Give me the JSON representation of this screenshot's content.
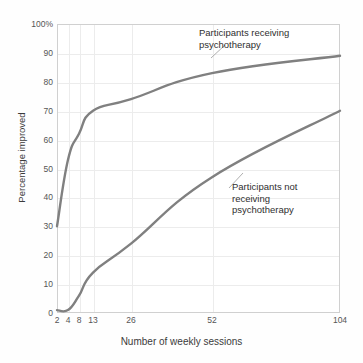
{
  "chart_data": {
    "type": "line",
    "title": "",
    "xlabel": "Number of weekly sessions",
    "ylabel": "Percentage improved",
    "x": [
      2,
      4,
      8,
      13,
      26,
      52,
      104
    ],
    "categories": [
      "2",
      "4",
      "8",
      "13",
      "26",
      "52",
      "104"
    ],
    "xtick_labels": [
      "2",
      "4",
      "8",
      "13",
      "26",
      "52",
      "104"
    ],
    "ytick_labels": [
      "0",
      "10",
      "20",
      "30",
      "40",
      "50",
      "60",
      "70",
      "80",
      "90",
      "100%"
    ],
    "ytick_values": [
      0,
      10,
      20,
      30,
      40,
      50,
      60,
      70,
      80,
      90,
      100
    ],
    "ylim": [
      0,
      100
    ],
    "xscale": "log",
    "grid": true,
    "legend": "annotations",
    "series": [
      {
        "name": "Participants receiving psychotherapy",
        "color": "#808080",
        "values": [
          30,
          53,
          62,
          70,
          74,
          83,
          89
        ]
      },
      {
        "name": "Participants not receiving psychotherapy",
        "color": "#808080",
        "values": [
          1,
          1,
          6,
          14,
          24,
          47,
          70
        ]
      }
    ],
    "annotations": [
      {
        "id": "treated",
        "text": "Participants receiving\npsychotherapy",
        "points_to_x": 52,
        "points_to_y": 83
      },
      {
        "id": "control",
        "text": "Participants not\nreceiving\npsychotherapy",
        "points_to_x": 63,
        "points_to_y": 53
      }
    ]
  },
  "axes": {
    "y_title": "Percentage improved",
    "x_title": "Number of weekly sessions"
  },
  "colors": {
    "line": "#808080",
    "grid": "#ececec",
    "frame": "#d0d0d0",
    "tick_text": "#555555",
    "annotation_text": "#2f2f2f",
    "leader": "#9a9a9a",
    "background": "#fefefe"
  }
}
